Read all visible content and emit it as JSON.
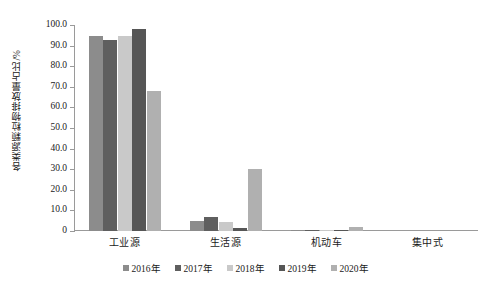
{
  "chart_data": {
    "type": "bar",
    "title": "",
    "subtitle": "",
    "xlabel": "",
    "ylabel": "各类源颗粒物排放量占比/%",
    "ylim": [
      0,
      100
    ],
    "ytick_step": 10,
    "ytick_labels": [
      "0",
      "10.0",
      "20.0",
      "30.0",
      "40.0",
      "50.0",
      "60.0",
      "70.0",
      "80.0",
      "90.0",
      "100.0"
    ],
    "grid": false,
    "legend_position": "bottom",
    "categories": [
      "工业源",
      "生活源",
      "机动车",
      "集中式"
    ],
    "series": [
      {
        "name": "2016年",
        "color": "#8c8c8c",
        "values": [
          94.5,
          5.0,
          0.5,
          0.0
        ]
      },
      {
        "name": "2017年",
        "color": "#5f5f5f",
        "values": [
          92.5,
          6.8,
          0.7,
          0.0
        ]
      },
      {
        "name": "2018年",
        "color": "#c9c9c9",
        "values": [
          94.8,
          4.2,
          0.5,
          0.0
        ]
      },
      {
        "name": "2019年",
        "color": "#565656",
        "values": [
          98.0,
          1.4,
          0.3,
          0.0
        ]
      },
      {
        "name": "2020年",
        "color": "#b0b0b0",
        "values": [
          68.0,
          30.0,
          2.0,
          0.0
        ]
      }
    ]
  },
  "axis": {
    "y_title": "各类源颗粒物排放量占比/%"
  },
  "legend": {
    "items": [
      {
        "label": "2016年"
      },
      {
        "label": "2017年"
      },
      {
        "label": "2018年"
      },
      {
        "label": "2019年"
      },
      {
        "label": "2020年"
      }
    ]
  }
}
